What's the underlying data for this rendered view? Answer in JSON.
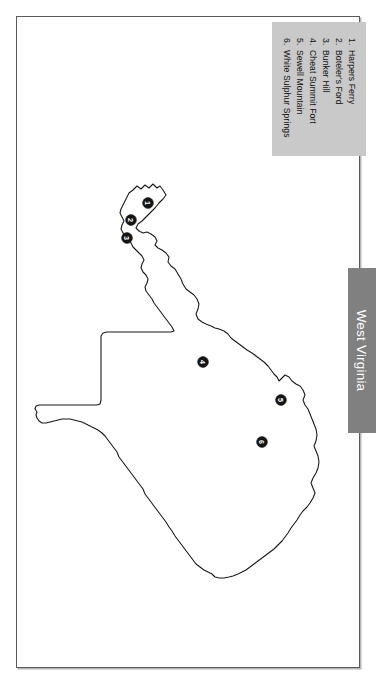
{
  "page": {
    "title": "West Virginia",
    "background_color": "#ffffff",
    "frame_color": "#5a5a5a"
  },
  "region_tab": {
    "label": "West Virginia",
    "background_color": "#808080",
    "text_color": "#ffffff",
    "orientation": "vertical"
  },
  "legend": {
    "background_color": "#c9c9c9",
    "text_color": "#111111",
    "orientation": "vertical",
    "items": [
      {
        "number": "1.",
        "label": "Harpers Ferry"
      },
      {
        "number": "2.",
        "label": "Boteler's Ford"
      },
      {
        "number": "3.",
        "label": "Bunker Hill"
      },
      {
        "number": "4.",
        "label": "Cheat Summit Fort"
      },
      {
        "number": "5.",
        "label": "Sewell Mountain"
      },
      {
        "number": "6.",
        "label": "White Sulphur Springs"
      }
    ]
  },
  "map": {
    "state": "West Virginia",
    "outline_color": "#1a1a1a",
    "fill_color": "#ffffff",
    "marker_color": "#141414",
    "marker_label_color": "#ffffff",
    "markers": [
      {
        "number": "1",
        "label": "Harpers Ferry",
        "x": 148,
        "y": 203
      },
      {
        "number": "2",
        "label": "Boteler's Ford",
        "x": 131,
        "y": 220
      },
      {
        "number": "3",
        "label": "Bunker Hill",
        "x": 127,
        "y": 238
      },
      {
        "number": "4",
        "label": "Cheat Summit Fort",
        "x": 203,
        "y": 362
      },
      {
        "number": "5",
        "label": "Sewell Mountain",
        "x": 281,
        "y": 400
      },
      {
        "number": "6",
        "label": "White Sulphur Springs",
        "x": 262,
        "y": 442
      }
    ]
  }
}
